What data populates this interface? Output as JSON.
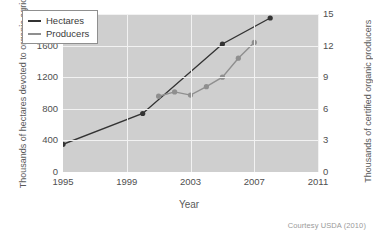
{
  "credit": "Courtesy USDA (2010)",
  "legend": {
    "position": "top-left",
    "items": [
      {
        "label": "Hectares",
        "color": "#333333"
      },
      {
        "label": "Producers",
        "color": "#8f8f8f"
      }
    ]
  },
  "chart_data": {
    "type": "line",
    "title": "",
    "xlabel": "Year",
    "ylabel": "Thousands of hectares devoted to organic agriculture",
    "ylabel_right": "Thousands of certified organic producers",
    "xlim": [
      1995,
      2011
    ],
    "xticks": [
      1995,
      1999,
      2003,
      2007,
      2011
    ],
    "xtick_labels": [
      "1995",
      "1999",
      "2003",
      "2007",
      "2011"
    ],
    "ylim": [
      0,
      2000
    ],
    "yticks": [
      0,
      400,
      800,
      1200,
      1600,
      2000
    ],
    "ytick_labels": [
      "0",
      "400",
      "800",
      "1200",
      "1600",
      "2000"
    ],
    "ylim_right": [
      0,
      15
    ],
    "yticks_right": [
      0,
      3,
      6,
      9,
      12,
      15
    ],
    "ytick_labels_right": [
      "0",
      "3",
      "6",
      "9",
      "12",
      "15"
    ],
    "grid": true,
    "grid_color": "#f2f2f2",
    "panel_color": "#cfcfcf",
    "series": [
      {
        "name": "Hectares",
        "axis": "left",
        "color": "#333333",
        "marker": "circle",
        "x": [
          1995,
          2000,
          2005,
          2008
        ],
        "values": [
          350,
          740,
          1620,
          1950
        ]
      },
      {
        "name": "Producers",
        "axis": "right",
        "color": "#8f8f8f",
        "marker": "circle",
        "x": [
          2001,
          2002,
          2003,
          2004,
          2005,
          2006,
          2007
        ],
        "values": [
          7.2,
          7.6,
          7.3,
          8.1,
          9.0,
          10.8,
          12.3
        ]
      }
    ]
  }
}
